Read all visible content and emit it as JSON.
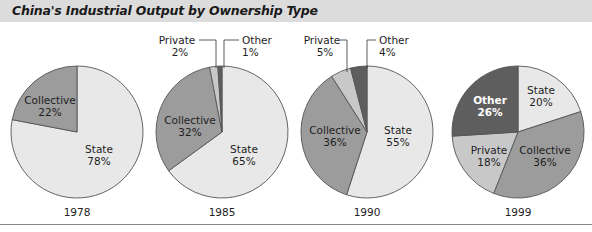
{
  "title": "China's Industrial Output by Ownership Type",
  "colors": {
    "State": "#e8e8e8",
    "Collective": "#9c9c9c",
    "Private": "#c8c8c8",
    "Other": "#5e5e5e",
    "outline": "#555555",
    "title_bg": "#dcdcdc"
  },
  "chart_data": [
    {
      "type": "pie",
      "title": "1978",
      "categories": [
        "State",
        "Collective"
      ],
      "values": [
        78,
        22
      ],
      "labels": [
        "State 78%",
        "Collective 22%"
      ]
    },
    {
      "type": "pie",
      "title": "1985",
      "categories": [
        "State",
        "Collective",
        "Private",
        "Other"
      ],
      "values": [
        65,
        32,
        2,
        1
      ],
      "labels": [
        "State 65%",
        "Collective 32%",
        "Private 2%",
        "Other 1%"
      ]
    },
    {
      "type": "pie",
      "title": "1990",
      "categories": [
        "State",
        "Collective",
        "Private",
        "Other"
      ],
      "values": [
        55,
        36,
        5,
        4
      ],
      "labels": [
        "State 55%",
        "Collective 36%",
        "Private 5%",
        "Other 4%"
      ]
    },
    {
      "type": "pie",
      "title": "1999",
      "categories": [
        "State",
        "Collective",
        "Private",
        "Other"
      ],
      "values": [
        20,
        36,
        18,
        26
      ],
      "labels": [
        "State 20%",
        "Collective 36%",
        "Private 18%",
        "Other 26%"
      ]
    }
  ],
  "years": [
    "1978",
    "1985",
    "1990",
    "1999"
  ],
  "labels": {
    "c1978": {
      "collective_name": "Collective",
      "collective_pct": "22%",
      "state_name": "State",
      "state_pct": "78%"
    },
    "c1985": {
      "private_name": "Private",
      "private_pct": "2%",
      "other_name": "Other",
      "other_pct": "1%",
      "collective_name": "Collective",
      "collective_pct": "32%",
      "state_name": "State",
      "state_pct": "65%"
    },
    "c1990": {
      "private_name": "Private",
      "private_pct": "5%",
      "other_name": "Other",
      "other_pct": "4%",
      "collective_name": "Collective",
      "collective_pct": "36%",
      "state_name": "State",
      "state_pct": "55%"
    },
    "c1999": {
      "other_name": "Other",
      "other_pct": "26%",
      "state_name": "State",
      "state_pct": "20%",
      "private_name": "Private",
      "private_pct": "18%",
      "collective_name": "Collective",
      "collective_pct": "36%"
    }
  }
}
